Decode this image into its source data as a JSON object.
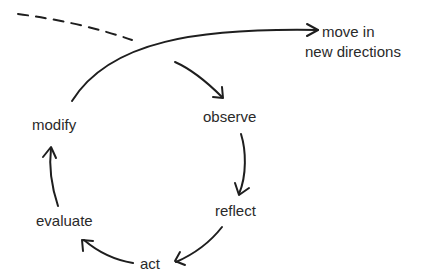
{
  "diagram": {
    "type": "cycle",
    "nodes": {
      "observe": "observe",
      "reflect": "reflect",
      "act": "act",
      "evaluate": "evaluate",
      "modify": "modify",
      "exit_line1": "move in",
      "exit_line2": "new directions"
    },
    "cycle_order": [
      "observe",
      "reflect",
      "act",
      "evaluate",
      "modify"
    ],
    "exit_edge": {
      "from": "modify",
      "to": "move in new directions"
    },
    "incoming_edge": {
      "style": "dashed",
      "to": "observe"
    },
    "colors": {
      "stroke": "#1e1e1e",
      "text": "#2a2a2a",
      "background": "#ffffff"
    }
  }
}
